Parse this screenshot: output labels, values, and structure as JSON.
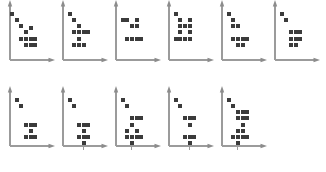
{
  "figure": {
    "background_color": "#ffffff",
    "dot_color": "#3b3b3b",
    "axis_color": "#9b9b9b",
    "dot_size": 4,
    "panel_width": 53,
    "panel_height": 72,
    "rows": 2,
    "columns": 5
  },
  "chart_data": {
    "type": "scatter",
    "xlabel": "",
    "ylabel": "",
    "grid": false,
    "legend": "none",
    "axis_style": "arrow-headed L-shaped axes, no tick labels",
    "xlim": [
      0,
      40
    ],
    "ylim": [
      0,
      50
    ],
    "panels": [
      {
        "id": "panel-1",
        "row": 1,
        "col": 1,
        "origin": [
          4,
          0
        ],
        "points": [
          [
            5,
            30
          ],
          [
            9,
            26
          ],
          [
            13,
            22
          ],
          [
            17,
            18
          ],
          [
            21,
            21
          ],
          [
            13,
            14
          ],
          [
            17,
            14
          ],
          [
            21,
            14
          ],
          [
            17,
            10
          ],
          [
            21,
            10
          ],
          [
            25,
            14
          ],
          [
            25,
            10
          ]
        ]
      },
      {
        "id": "panel-2",
        "row": 1,
        "col": 2,
        "origin": [
          57,
          0
        ],
        "points": [
          [
            9,
            30
          ],
          [
            13,
            26
          ],
          [
            17,
            22
          ],
          [
            13,
            18
          ],
          [
            17,
            18
          ],
          [
            21,
            18
          ],
          [
            25,
            18
          ],
          [
            17,
            14
          ],
          [
            17,
            10
          ],
          [
            13,
            10
          ],
          [
            21,
            10
          ]
        ]
      },
      {
        "id": "panel-3",
        "row": 1,
        "col": 3,
        "origin": [
          110,
          0
        ],
        "points": [
          [
            9,
            26
          ],
          [
            13,
            26
          ],
          [
            21,
            26
          ],
          [
            21,
            22
          ],
          [
            17,
            22
          ],
          [
            13,
            14
          ],
          [
            17,
            14
          ],
          [
            21,
            14
          ],
          [
            25,
            14
          ]
        ]
      },
      {
        "id": "panel-4",
        "row": 1,
        "col": 4,
        "origin": [
          163,
          0
        ],
        "points": [
          [
            9,
            30
          ],
          [
            13,
            26
          ],
          [
            21,
            26
          ],
          [
            13,
            22
          ],
          [
            17,
            22
          ],
          [
            21,
            22
          ],
          [
            13,
            18
          ],
          [
            21,
            18
          ],
          [
            13,
            14
          ],
          [
            17,
            14
          ],
          [
            21,
            14
          ],
          [
            9,
            14
          ]
        ]
      },
      {
        "id": "panel-5",
        "row": 1,
        "col": 5,
        "origin": [
          216,
          0
        ],
        "points": [
          [
            9,
            30
          ],
          [
            13,
            26
          ],
          [
            17,
            22
          ],
          [
            13,
            22
          ],
          [
            17,
            14
          ],
          [
            13,
            14
          ],
          [
            21,
            14
          ],
          [
            25,
            14
          ],
          [
            17,
            10
          ],
          [
            21,
            10
          ]
        ]
      },
      {
        "id": "panel-6",
        "row": 1,
        "col": 6,
        "origin": [
          269,
          0
        ],
        "points": [
          [
            9,
            30
          ],
          [
            13,
            26
          ],
          [
            17,
            18
          ],
          [
            21,
            18
          ],
          [
            25,
            18
          ],
          [
            17,
            14
          ],
          [
            21,
            14
          ],
          [
            25,
            14
          ],
          [
            21,
            10
          ],
          [
            17,
            10
          ]
        ]
      },
      {
        "id": "panel-7",
        "row": 2,
        "col": 1,
        "origin": [
          4,
          86
        ],
        "points": [
          [
            9,
            30
          ],
          [
            13,
            26
          ],
          [
            17,
            14
          ],
          [
            21,
            14
          ],
          [
            25,
            14
          ],
          [
            21,
            10
          ],
          [
            17,
            6
          ],
          [
            21,
            6
          ],
          [
            25,
            6
          ]
        ]
      },
      {
        "id": "panel-8",
        "row": 2,
        "col": 2,
        "origin": [
          57,
          86
        ],
        "points": [
          [
            9,
            30
          ],
          [
            13,
            26
          ],
          [
            17,
            14
          ],
          [
            21,
            14
          ],
          [
            25,
            14
          ],
          [
            21,
            10
          ],
          [
            17,
            6
          ],
          [
            21,
            6
          ],
          [
            25,
            6
          ],
          [
            21,
            2
          ]
        ]
      },
      {
        "id": "panel-9",
        "row": 2,
        "col": 3,
        "origin": [
          110,
          86
        ],
        "points": [
          [
            9,
            30
          ],
          [
            13,
            26
          ],
          [
            17,
            18
          ],
          [
            21,
            18
          ],
          [
            17,
            14
          ],
          [
            25,
            18
          ],
          [
            13,
            10
          ],
          [
            21,
            10
          ],
          [
            13,
            6
          ],
          [
            17,
            6
          ],
          [
            21,
            6
          ],
          [
            25,
            6
          ],
          [
            17,
            2
          ]
        ]
      },
      {
        "id": "panel-10",
        "row": 2,
        "col": 4,
        "origin": [
          163,
          86
        ],
        "points": [
          [
            9,
            30
          ],
          [
            13,
            26
          ],
          [
            17,
            18
          ],
          [
            21,
            18
          ],
          [
            25,
            18
          ],
          [
            21,
            14
          ],
          [
            17,
            6
          ],
          [
            21,
            6
          ],
          [
            25,
            6
          ],
          [
            21,
            2
          ]
        ]
      },
      {
        "id": "panel-11",
        "row": 2,
        "col": 5,
        "origin": [
          216,
          86
        ],
        "points": [
          [
            9,
            30
          ],
          [
            13,
            26
          ],
          [
            17,
            22
          ],
          [
            21,
            22
          ],
          [
            25,
            22
          ],
          [
            17,
            18
          ],
          [
            21,
            18
          ],
          [
            25,
            18
          ],
          [
            21,
            14
          ],
          [
            17,
            10
          ],
          [
            21,
            10
          ],
          [
            13,
            6
          ],
          [
            17,
            6
          ],
          [
            21,
            6
          ],
          [
            25,
            6
          ],
          [
            17,
            2
          ]
        ]
      }
    ]
  }
}
